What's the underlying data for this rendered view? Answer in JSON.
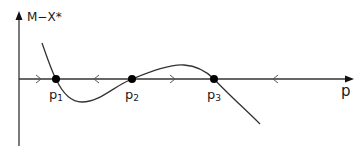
{
  "diagram": {
    "y_axis_label": "M−X*",
    "x_axis_label": "p",
    "fixed_points": [
      {
        "name": "p",
        "sub": "1",
        "x": 56
      },
      {
        "name": "p",
        "sub": "2",
        "x": 132
      },
      {
        "name": "p",
        "sub": "3",
        "x": 214
      }
    ],
    "flow_arrows": [
      {
        "x": 40,
        "direction": "right"
      },
      {
        "x": 95,
        "direction": "left"
      },
      {
        "x": 172,
        "direction": "right"
      },
      {
        "x": 275,
        "direction": "left"
      }
    ],
    "colors": {
      "line": "#333333",
      "dot": "#000000"
    }
  }
}
